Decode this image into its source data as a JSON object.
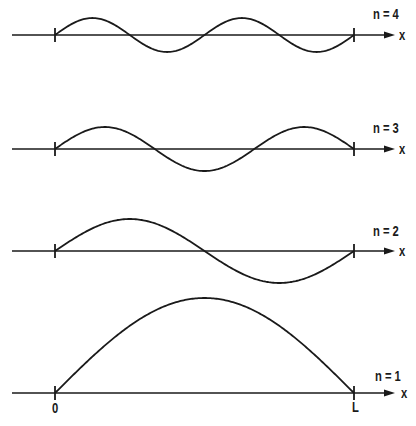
{
  "figure": {
    "axis_label": "x",
    "origin_label": "0",
    "end_label": "L",
    "line_color": "#1a1a1a",
    "background": "#ffffff"
  },
  "modes": [
    {
      "n": 4,
      "label": "n = 4",
      "axis_y": 35,
      "amplitude": 17,
      "half_wavelengths": 4
    },
    {
      "n": 3,
      "label": "n = 3",
      "axis_y": 149,
      "amplitude": 22,
      "half_wavelengths": 3
    },
    {
      "n": 2,
      "label": "n = 2",
      "axis_y": 251,
      "amplitude": 32,
      "half_wavelengths": 2
    },
    {
      "n": 1,
      "label": "n = 1",
      "axis_y": 393,
      "amplitude": 95,
      "half_wavelengths": 1
    }
  ],
  "geometry": {
    "axis_start_x": 12,
    "node_left_x": 55,
    "node_right_x": 354,
    "arrow_tip_x": 395
  }
}
